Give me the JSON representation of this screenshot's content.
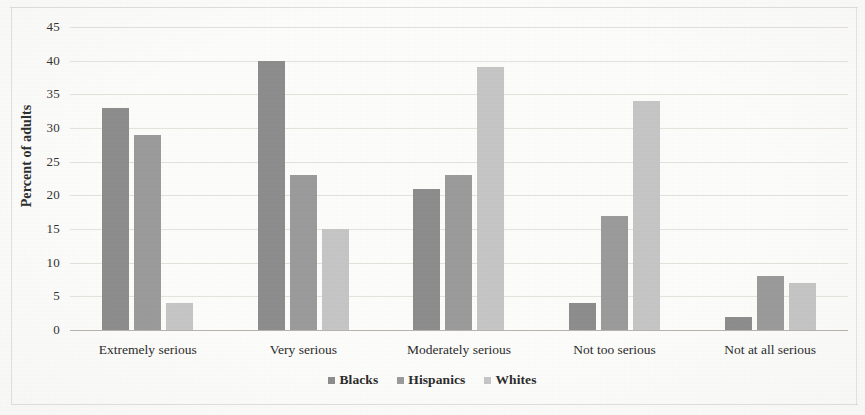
{
  "chart_data": {
    "type": "bar",
    "title": "",
    "subtitle": "",
    "xlabel": "",
    "ylabel": "Percent of adults",
    "categories": [
      "Extremely serious",
      "Very serious",
      "Moderately serious",
      "Not too serious",
      "Not at all serious"
    ],
    "series": [
      {
        "name": "Blacks",
        "color": "#8d8d8d",
        "values": [
          33,
          40,
          21,
          4,
          2
        ]
      },
      {
        "name": "Hispanics",
        "color": "#9b9b9b",
        "values": [
          29,
          23,
          23,
          17,
          8
        ]
      },
      {
        "name": "Whites",
        "color": "#c6c6c6",
        "values": [
          4,
          15,
          39,
          34,
          7
        ]
      }
    ],
    "ylim": [
      0,
      45
    ],
    "ytick_values": [
      0,
      5,
      10,
      15,
      20,
      25,
      30,
      35,
      40,
      45
    ],
    "ytick_labels": [
      "0",
      "5",
      "10",
      "15",
      "20",
      "25",
      "30",
      "35",
      "40",
      "45"
    ],
    "grid": true,
    "grid_axis": "y",
    "legend_position": "bottom",
    "bar_orientation": "vertical",
    "background_color": "#fdfdfb"
  },
  "legend": {
    "items": [
      {
        "label": "Blacks",
        "marker": "square-swatch-dark"
      },
      {
        "label": "Hispanics",
        "marker": "square-swatch-mid"
      },
      {
        "label": "Whites",
        "marker": "square-swatch-light"
      }
    ]
  },
  "axes": {
    "y_title": "Percent of adults"
  }
}
